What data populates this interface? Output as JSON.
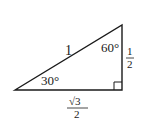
{
  "diagram": {
    "type": "right-triangle",
    "stroke_color": "#1a1a1a",
    "vertices": {
      "left": [
        15,
        90
      ],
      "top_right": [
        122,
        25
      ],
      "bottom_right": [
        122,
        90
      ]
    },
    "labels": {
      "hypotenuse": "1",
      "angle_left": "30°",
      "angle_top": "60°",
      "vertical_side_numerator": "1",
      "vertical_side_denominator": "2",
      "base_numerator": "√3",
      "base_denominator": "2"
    },
    "right_angle_marker": true
  }
}
